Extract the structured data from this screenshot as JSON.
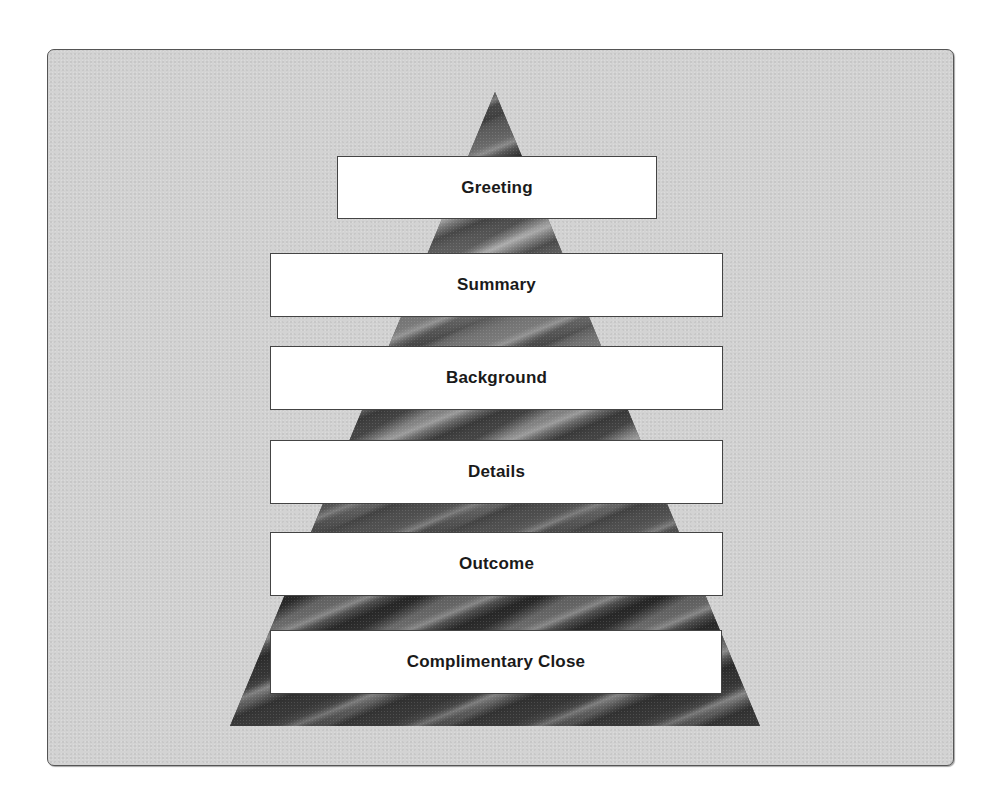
{
  "diagram": {
    "type": "pyramid",
    "colors": {
      "panel_background": "#d3d3d3",
      "panel_border": "#555555",
      "pyramid_texture": "#5a5a5a",
      "box_background": "#ffffff",
      "box_border": "#444444",
      "label_text": "#1a1a1a"
    },
    "levels": [
      {
        "label": "Greeting"
      },
      {
        "label": "Summary"
      },
      {
        "label": "Background"
      },
      {
        "label": "Details"
      },
      {
        "label": "Outcome"
      },
      {
        "label": "Complimentary Close"
      }
    ]
  }
}
